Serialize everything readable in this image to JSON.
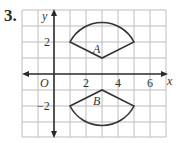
{
  "problem": {
    "number": "3."
  },
  "axes": {
    "x_label": "x",
    "y_label": "y",
    "origin_label": "O",
    "x_ticks": [
      {
        "value": 2,
        "label": "2"
      },
      {
        "value": 4,
        "label": "4"
      },
      {
        "value": 6,
        "label": "6"
      }
    ],
    "y_ticks": [
      {
        "value": 2,
        "label": "2"
      },
      {
        "value": -2,
        "label": "−2"
      }
    ],
    "x_range": [
      -2,
      7
    ],
    "y_range": [
      -4,
      4
    ],
    "grid": true
  },
  "shapes": [
    {
      "name": "A",
      "label": "A",
      "vertices": [
        [
          1,
          2
        ],
        [
          3,
          1
        ],
        [
          5,
          2
        ]
      ],
      "arc_top": [
        3,
        3
      ],
      "description": "Sector with vertex at (3,1), straight edges to (1,2) and (5,2), arc bulging up to y≈3"
    },
    {
      "name": "B",
      "label": "B",
      "vertices": [
        [
          1,
          -2
        ],
        [
          3,
          -1
        ],
        [
          5,
          -2
        ]
      ],
      "arc_bottom": [
        3,
        -3
      ],
      "description": "Reflection of A in x-axis: vertex at (3,-1), edges to (1,-2) and (5,-2), arc bulging down to y≈-3"
    }
  ],
  "colors": {
    "grid": "#b8b8b8",
    "axis": "#2a2a2a",
    "shape": "#333333"
  }
}
